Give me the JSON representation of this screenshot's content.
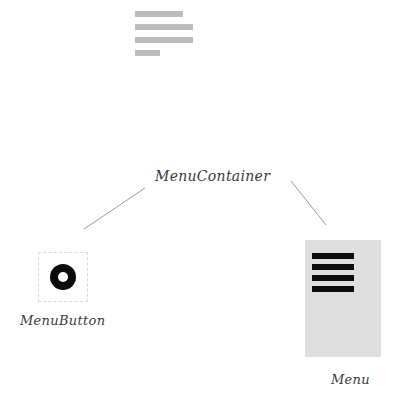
{
  "canvas": {
    "width": 401,
    "height": 414,
    "background": "#ffffff"
  },
  "wireframe": {
    "name": "text-lines-block",
    "line_color": "#bcbcbc",
    "lines": [
      {
        "id": "line-1",
        "width_px": 48
      },
      {
        "id": "line-2",
        "width_px": 58
      },
      {
        "id": "line-3",
        "width_px": 58
      },
      {
        "id": "line-4",
        "width_px": 25
      }
    ]
  },
  "nodes": {
    "container": {
      "label": "MenuContainer"
    },
    "menu_button": {
      "label": "MenuButton",
      "icon": "circle-ring-icon",
      "icon_color": "#0b0b0b",
      "border_style": "dashed",
      "border_color": "#d8d8d8"
    },
    "menu_panel": {
      "label": "Menu",
      "background": "#dedede",
      "item_color": "#0b0b0b",
      "items": [
        {
          "id": "menu-item-1"
        },
        {
          "id": "menu-item-2"
        },
        {
          "id": "menu-item-3"
        },
        {
          "id": "menu-item-4"
        }
      ]
    }
  },
  "connectors": [
    {
      "id": "connector-left",
      "from": "container",
      "to": "menu-button",
      "color": "#9a9a9a"
    },
    {
      "id": "connector-right",
      "from": "container",
      "to": "menu-panel",
      "color": "#9a9a9a"
    }
  ]
}
